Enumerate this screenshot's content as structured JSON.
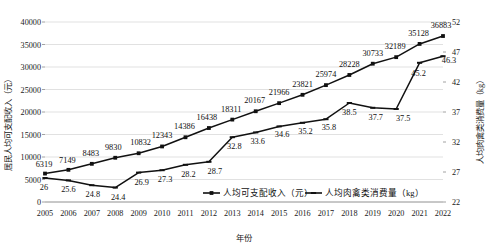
{
  "chart_data": {
    "type": "line",
    "title": "",
    "xlabel": "年份",
    "categories": [
      "2005",
      "2006",
      "2007",
      "2008",
      "2009",
      "2010",
      "2011",
      "2012",
      "2013",
      "2014",
      "2015",
      "2016",
      "2017",
      "2018",
      "2019",
      "2020",
      "2021",
      "2022"
    ],
    "grid": true,
    "legend_position": "bottom",
    "y_left": {
      "label": "居民人均可支配收入（元）",
      "ticks": [
        "0",
        "5000",
        "10000",
        "15000",
        "20000",
        "25000",
        "30000",
        "35000",
        "40000"
      ],
      "ylim": [
        0,
        40000
      ]
    },
    "y_right": {
      "label": "人均肉禽类消费量（kg）",
      "ticks": [
        "22",
        "27",
        "32",
        "37",
        "42",
        "47",
        "52"
      ],
      "ylim": [
        22,
        52
      ]
    },
    "series": [
      {
        "name": "人均可支配收入（元）",
        "axis": "left",
        "marker": "square",
        "color": "#111111",
        "values": [
          6319,
          7149,
          8483,
          9830,
          10832,
          12343,
          14386,
          16438,
          18311,
          20167,
          21966,
          23821,
          25974,
          28228,
          30733,
          32189,
          35128,
          36883
        ],
        "labels": [
          "6319",
          "7149",
          "8483",
          "9830",
          "10832",
          "12343",
          "14386",
          "16438",
          "18311",
          "20167",
          "21966",
          "23821",
          "25974",
          "28228",
          "30733",
          "32189",
          "35128",
          "36883"
        ]
      },
      {
        "name": "人均肉禽类消费量（kg）",
        "axis": "right",
        "marker": "dash",
        "color": "#111111",
        "values": [
          26,
          25.6,
          24.8,
          24.4,
          26.9,
          27.3,
          28.2,
          28.7,
          32.8,
          33.6,
          34.6,
          35.2,
          35.8,
          38.5,
          37.7,
          37.5,
          45.2,
          46.3
        ],
        "labels": [
          "26",
          "25.6",
          "24.8",
          "24.4",
          "26.9",
          "27.3",
          "28.2",
          "28.7",
          "32.8",
          "33.6",
          "34.6",
          "35.2",
          "35.8",
          "38.5",
          "37.7",
          "37.5",
          "45.2",
          "46.3"
        ]
      }
    ]
  }
}
